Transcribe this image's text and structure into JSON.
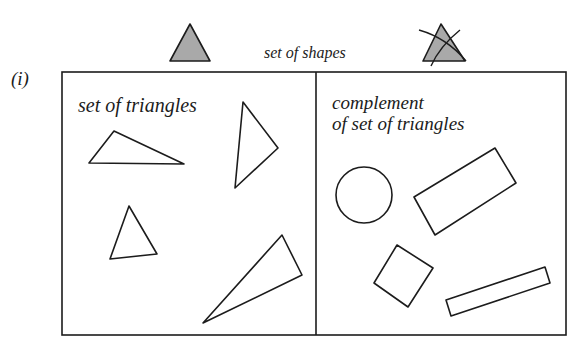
{
  "part_label": "(i)",
  "header": {
    "universe_label": "set of shapes",
    "legend_included": {
      "shape": "triangle",
      "fill": "#a9a9a9",
      "crossed_out": false
    },
    "legend_excluded": {
      "shape": "triangle",
      "fill": "#a9a9a9",
      "crossed_out": true
    }
  },
  "regions": {
    "left": {
      "label": "set of triangles",
      "shapes": [
        {
          "type": "triangle",
          "points": "114,131 89,163 184,164"
        },
        {
          "type": "triangle",
          "points": "243,102 278,148 235,188"
        },
        {
          "type": "triangle",
          "points": "129,206 110,259 157,254"
        },
        {
          "type": "triangle",
          "points": "282,235 302,275 203,323"
        }
      ]
    },
    "right": {
      "label_line1": "complement",
      "label_line2": "of set of triangles",
      "shapes": [
        {
          "type": "circle",
          "cx": 364,
          "cy": 195,
          "r": 28
        },
        {
          "type": "rectangle",
          "points": "414,197 495,148 516,183 435,235"
        },
        {
          "type": "square",
          "points": "397,245 433,268 408,307 374,283"
        },
        {
          "type": "rectangle",
          "points": "446,300 545,267 550,283 451,316"
        }
      ]
    }
  },
  "colors": {
    "stroke": "#1c1c1c",
    "legend_fill": "#a9a9a9",
    "background": "#ffffff"
  }
}
